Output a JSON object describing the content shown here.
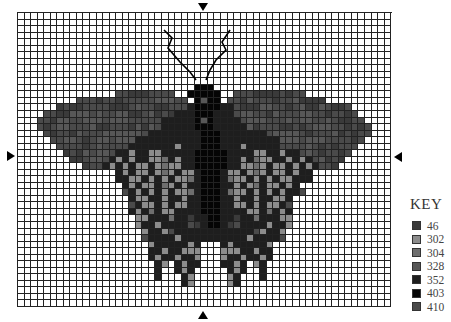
{
  "chart_data": {
    "type": "heatmap",
    "columns": 57,
    "rows": 45,
    "legend_title": "KEY",
    "legend": [
      {
        "code": "46",
        "color": "#3a3a3a",
        "symbol": "d"
      },
      {
        "code": "302",
        "color": "#8c8c8c",
        "symbol": "g"
      },
      {
        "code": "304",
        "color": "#6e6e6e",
        "symbol": "e"
      },
      {
        "code": "328",
        "color": "#575757",
        "symbol": "f"
      },
      {
        "code": "352",
        "color": "#1e1e1e",
        "symbol": "b"
      },
      {
        "code": "403",
        "color": "#050505",
        "symbol": "a"
      },
      {
        "code": "410",
        "color": "#4a4a4a",
        "symbol": "c"
      }
    ],
    "center_markers": [
      "top",
      "bottom",
      "left",
      "right"
    ],
    "pattern": [
      ".........................................................",
      ".........................................................",
      ".........................................................",
      ".........................................................",
      ".........................................................",
      ".........................................................",
      ".........................................................",
      ".........................................................",
      ".........................................................",
      ".........................................................",
      ".........................................................",
      "...........................aaa...........................",
      "...............ccdddcccc..aaaaa..cccddddcdcc.............",
      ".........cccdccdcccccfffcc.afaa.ccdfcccdccfdddd..........",
      "......dcddccccdddcfccddcccbaaaabbcdddffccdcfddfcddc......",
      "....ccddfffcfccffddcfdcdbbbaaabbbcffccdfcccffccdccdc.....",
      "...ccdffccfffcfffcccccbbbbbafabbbbcfffcccfcffccfcddcc....",
      "...cdcffcccfddcccdfdfcbbbbbaaabbbbbfdcccddcdcfffccdcdc...",
      "....cdccdfcccffffffcbbbbbbbbaaabbbbbbbcffffcdcccfdcdcc...",
      ".....ccffcdcffcfffbbbbbbbbbbaaabbbbbbbbbfffcfffccccdc....",
      "......ccccdcfccccbbbbbbbgbbbaaabbbgbbbbbccccfcdcdccc.....",
      ".......dcdfcffcbbgbbggbbbbbaaaaabbbbggbbgbbcfcdccdc......",
      "........ddcffcbgbgbbggebgbbaaaaabbgbeggbbgbgbcfdcd.......",
      "..........dccbgbgbggbgeggbbaaaaabbggegbggbgbgbccd........",
      "...............bgbggbgegbggbaaabggbgegbggbgbb............",
      "...............bbggbgbgbggebaaabeggbgbgbggbbb............",
      "................bgbggbegbgbbaaabbgbgebggbgb..............",
      "................cbgbgbgbggebaaabeggbgbgbgbbc.............",
      ".................bggbbgbbgbbaaabbgbbgbbggb...............",
      ".................cbggbgbggbbaaabbggbgbggbc...............",
      ".................bgbebggbbbbaaabbbbggbebgb...............",
      "..................ggbbbebbdbbaabbdbbebbbgg...............",
      "..................gbbgbbbbcdbaabdcbbbbgbbg...............",
      "...................gbbgcbbbbbbbbbbbbcgbbg................",
      "...................cbbbbgbbbbbbbbbbgbbbbc................",
      "....................gbbbbbgb...bgbbbbbg..................",
      "....................bbgbbggg...gggbbgbb..................",
      "....................bgbbgbbg...gbbgbbgb..................",
      ".....................bg.bgbb...bbgb.gb...................",
      ".....................b..bgb.....bgb..b...................",
      ".....................b...bg.....gb...b...................",
      ".........................bg.....gb.......................",
      ".........................................................",
      ".........................................................",
      "........................................................."
    ],
    "antennae": [
      {
        "points": "164,30 172,38 168,48 180,62 190,72 196,80"
      },
      {
        "points": "230,30 222,42 226,50 216,60 210,70 206,80"
      }
    ]
  },
  "ui": {
    "key_title": "KEY",
    "key_labels": [
      "46",
      "302",
      "304",
      "328",
      "352",
      "403",
      "410"
    ]
  }
}
